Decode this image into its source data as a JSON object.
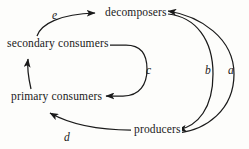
{
  "diagram": {
    "background_color": "#fdfdfb",
    "stroke_color": "#1a1a1a",
    "nodes": [
      {
        "id": "decomposers",
        "label": "decomposers"
      },
      {
        "id": "secondary_consumers",
        "label": "secondary consumers"
      },
      {
        "id": "primary_consumers",
        "label": "primary consumers"
      },
      {
        "id": "producers",
        "label": "producers"
      }
    ],
    "edges": [
      {
        "id": "a",
        "label": "a",
        "from": "producers",
        "to": "decomposers",
        "shape": "outer-right-arc"
      },
      {
        "id": "b",
        "label": "b",
        "from": "decomposers",
        "to": "producers",
        "shape": "inner-right-arc"
      },
      {
        "id": "c",
        "label": "c",
        "from": "secondary consumers",
        "to": "primary consumers",
        "shape": "right-loop"
      },
      {
        "id": "d",
        "label": "d",
        "from": "producers",
        "to": "primary consumers",
        "shape": "bottom-left-curve"
      },
      {
        "id": "e",
        "label": "e",
        "from": "secondary consumers",
        "to": "decomposers",
        "shape": "top-left-curve"
      },
      {
        "id": "f",
        "label": "",
        "from": "primary consumers",
        "to": "secondary consumers",
        "shape": "vertical-left"
      }
    ]
  }
}
